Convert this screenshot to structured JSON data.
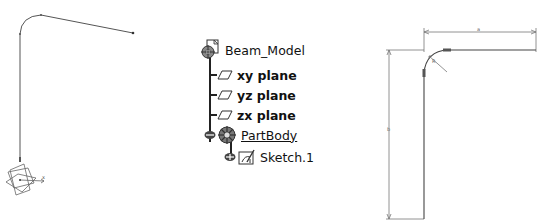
{
  "left_view": {
    "description": "3D sketch path with axis system",
    "axis_label": "x"
  },
  "tree": {
    "root": {
      "label": "Beam_Model",
      "icon": "part-document-icon"
    },
    "items": [
      {
        "label": "xy plane",
        "icon": "plane-icon"
      },
      {
        "label": "yz plane",
        "icon": "plane-icon"
      },
      {
        "label": "zx plane",
        "icon": "plane-icon"
      },
      {
        "label": "PartBody",
        "icon": "body-gear-icon",
        "underlined": true
      },
      {
        "label": "Sketch.1",
        "icon": "sketch-icon"
      }
    ]
  },
  "right_view": {
    "description": "2D sketch with dimensions",
    "dim_horizontal": "a",
    "dim_vertical": "b",
    "dim_radius": "R"
  },
  "colors": {
    "line": "#555555",
    "dim": "#777777",
    "text": "#111111",
    "tree_line": "#222222"
  }
}
